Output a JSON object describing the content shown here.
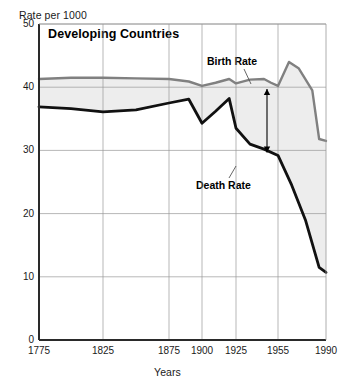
{
  "chart_data": {
    "type": "line",
    "title": "Developing Countries",
    "ylabel": "Rate per 1000",
    "xlabel": "Years",
    "ylim": [
      0,
      50
    ],
    "yticks": [
      0,
      10,
      20,
      30,
      40,
      50
    ],
    "ytick_labels": [
      "0",
      "10",
      "20",
      "30",
      "40",
      "50"
    ],
    "xlim": [
      1775,
      1990
    ],
    "xticks": [
      1775,
      1825,
      1875,
      1900,
      1925,
      1955,
      1990
    ],
    "xtick_labels": [
      "1775",
      "1825",
      "1875",
      "1900",
      "1925",
      "1955",
      "1990"
    ],
    "grid": true,
    "legend": "inline-annotations",
    "fill_between": {
      "label": "Natural Increase",
      "color": "#ededed",
      "upper_series": "Birth Rate",
      "lower_series": "Death Rate"
    },
    "annotations": [
      {
        "text": "Birth Rate",
        "x": 1930,
        "y": 46.5
      },
      {
        "text": "Death Rate",
        "x": 1922,
        "y": 28.0
      },
      {
        "text": "Natural Increase",
        "x": 1950,
        "y": 34.5
      }
    ],
    "series": [
      {
        "name": "Birth Rate",
        "color": "#808080",
        "x": [
          1775,
          1800,
          1825,
          1850,
          1875,
          1890,
          1900,
          1910,
          1920,
          1925,
          1935,
          1945,
          1950,
          1955,
          1963,
          1970,
          1980,
          1985,
          1990
        ],
        "values": [
          41.3,
          41.5,
          41.5,
          41.4,
          41.3,
          40.9,
          40.2,
          40.7,
          41.3,
          40.6,
          41.2,
          41.3,
          40.7,
          40.2,
          44.0,
          43.0,
          39.5,
          31.8,
          31.5
        ]
      },
      {
        "name": "Death Rate",
        "color": "#111111",
        "x": [
          1775,
          1800,
          1825,
          1850,
          1875,
          1890,
          1900,
          1910,
          1920,
          1925,
          1935,
          1945,
          1955,
          1965,
          1975,
          1985,
          1990
        ],
        "values": [
          36.9,
          36.6,
          36.1,
          36.4,
          37.5,
          38.1,
          34.3,
          36.2,
          38.2,
          33.5,
          31.0,
          30.2,
          29.2,
          24.5,
          19.0,
          11.5,
          10.7
        ]
      }
    ]
  },
  "labels": {
    "title": "Developing Countries",
    "y_axis_title": "Rate per 1000",
    "x_axis_title": "Years",
    "birth_rate": "Birth Rate",
    "death_rate": "Death Rate",
    "natural_increase": "Natural Increase"
  }
}
